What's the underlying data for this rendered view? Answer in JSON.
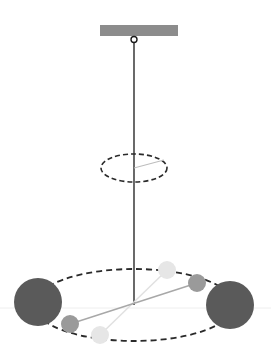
{
  "diagram": {
    "type": "torsion-balance",
    "colors": {
      "support_bar": "#8c8c8c",
      "wire": "#1a1a1a",
      "dashed_ellipse": "#2a2a2a",
      "large_sphere": "#5a5a5a",
      "small_sphere_current": "#9a9a9a",
      "small_sphere_initial": "#e6e6e6",
      "rod_current": "#a8a8a8",
      "rod_initial": "#e0e0e0",
      "angle_line": "#bdbdbd",
      "horizon_line": "#eeeeee"
    },
    "elements": {
      "support_bar": {
        "x": 100,
        "y": 25,
        "width": 78,
        "height": 11
      },
      "hook": {
        "cx": 134,
        "cy": 39,
        "r": 3
      },
      "wire": {
        "x": 134,
        "y1": 42,
        "y2": 305
      },
      "twist_indicator": {
        "cx": 134,
        "cy": 168,
        "rx": 33,
        "ry": 14,
        "line_to": [
          164,
          160
        ]
      },
      "orbit": {
        "cx": 134,
        "cy": 305,
        "rx": 100,
        "ry": 36
      },
      "large_spheres": [
        {
          "cx": 38,
          "cy": 302,
          "r": 24
        },
        {
          "cx": 230,
          "cy": 305,
          "r": 24
        }
      ],
      "rod_current": {
        "from": [
          70,
          324
        ],
        "to": [
          197,
          283
        ]
      },
      "small_spheres_current": [
        {
          "cx": 70,
          "cy": 324,
          "r": 9
        },
        {
          "cx": 197,
          "cy": 283,
          "r": 9
        }
      ],
      "rod_initial": {
        "from": [
          100,
          335
        ],
        "to": [
          167,
          270
        ]
      },
      "small_spheres_initial": [
        {
          "cx": 167,
          "cy": 270,
          "r": 9
        },
        {
          "cx": 100,
          "cy": 335,
          "r": 9
        }
      ]
    }
  }
}
